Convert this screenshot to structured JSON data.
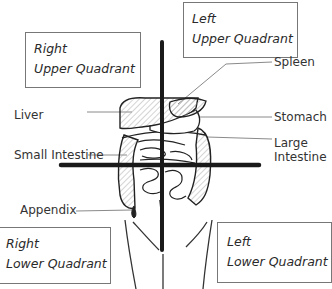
{
  "quadrants": {
    "right_upper": {
      "line1": "Right",
      "line2": "Upper Quadrant"
    },
    "left_upper": {
      "line1": "Left",
      "line2": "Upper Quadrant"
    },
    "right_lower": {
      "line1": "Right",
      "line2": "Lower Quadrant"
    },
    "left_lower": {
      "line1": "Left",
      "line2": "Lower Quadrant"
    }
  },
  "organs": {
    "liver": "Liver",
    "spleen": "Spleen",
    "stomach": "Stomach",
    "large_intestine_1": "Large",
    "large_intestine_2": "Intestine",
    "small_intestine": "Small Intestine",
    "appendix": "Appendix"
  },
  "colors": {
    "axis": "#1a1a1a",
    "outline": "#222222",
    "leader": "#888888",
    "hatch": "#999999"
  }
}
